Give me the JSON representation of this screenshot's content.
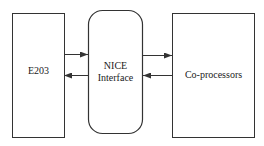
{
  "diagram": {
    "nodes": [
      {
        "id": "e203",
        "label": "E203"
      },
      {
        "id": "nice",
        "label_line1": "NICE",
        "label_line2": "Interface"
      },
      {
        "id": "coproc",
        "label": "Co-processors"
      }
    ],
    "edges": [
      {
        "from": "e203",
        "to": "nice"
      },
      {
        "from": "nice",
        "to": "e203"
      },
      {
        "from": "nice",
        "to": "coproc"
      },
      {
        "from": "coproc",
        "to": "nice"
      }
    ],
    "colors": {
      "stroke": "#333333",
      "background": "#ffffff"
    }
  }
}
